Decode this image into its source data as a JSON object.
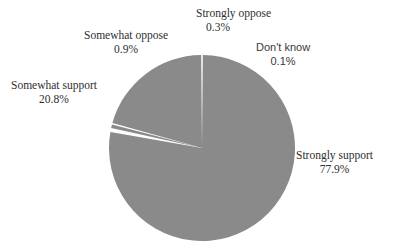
{
  "chart_data": {
    "type": "pie",
    "title": "",
    "subtitle": "",
    "xlabel": "",
    "ylabel": "",
    "legend_position": "none",
    "grid": false,
    "labels_outside": true,
    "start_angle_deg": 0,
    "direction": "clockwise",
    "categories": [
      "Strongly support",
      "Don't know",
      "Strongly oppose",
      "Somewhat oppose",
      "Somewhat support"
    ],
    "values": [
      77.9,
      0.1,
      0.3,
      0.9,
      20.8
    ],
    "value_labels": [
      "77.9%",
      "0.1%",
      "0.3%",
      "0.9%",
      "20.8%"
    ],
    "total": 100.0,
    "slice_color": "#8a8a8a",
    "separator_color": "#ffffff",
    "background": "#ffffff"
  },
  "labels": {
    "strongly_oppose": {
      "name": "Strongly oppose",
      "pct": "0.3%"
    },
    "somewhat_oppose": {
      "name": "Somewhat oppose",
      "pct": "0.9%"
    },
    "dont_know": {
      "name": "Don't know",
      "pct": "0.1%"
    },
    "somewhat_support": {
      "name": "Somewhat support",
      "pct": "20.8%"
    },
    "strongly_support": {
      "name": "Strongly support",
      "pct": "77.9%"
    }
  },
  "colors": {
    "slice": "#8a8a8a",
    "separator": "#ffffff",
    "text": "#2e2e2e",
    "background": "#ffffff"
  }
}
